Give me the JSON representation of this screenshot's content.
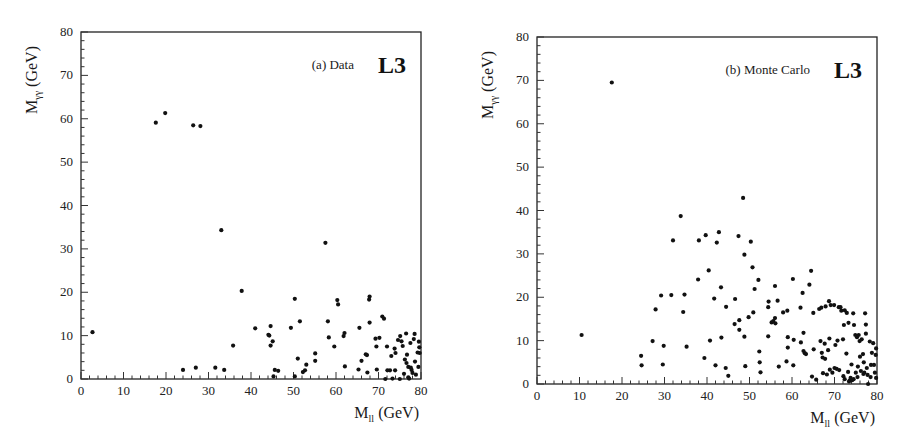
{
  "chart_data": [
    {
      "type": "scatter",
      "panel": "a",
      "label": "(a) Data",
      "logo": "L3",
      "xlabel": "M_ll (GeV)",
      "xlabel_main": "M",
      "xlabel_sub": "ll",
      "xlabel_unit": " (GeV)",
      "ylabel": "M_γγ (GeV)",
      "ylabel_main": "M",
      "ylabel_sub": "γγ",
      "ylabel_unit": " (GeV)",
      "xlim": [
        0,
        80
      ],
      "ylim": [
        0,
        80
      ],
      "xticks": [
        0,
        10,
        20,
        30,
        40,
        50,
        60,
        70,
        80
      ],
      "yticks": [
        0,
        10,
        20,
        30,
        40,
        50,
        60,
        70,
        80
      ],
      "grid": false,
      "marker": "filled-circle",
      "color": "#111111",
      "frame": {
        "x0": 81,
        "x1": 421,
        "y0": 379,
        "y1": 32
      },
      "points": [
        [
          2.7,
          10.8
        ],
        [
          17.6,
          59.1
        ],
        [
          19.8,
          61.3
        ],
        [
          26.4,
          58.5
        ],
        [
          28.1,
          58.3
        ],
        [
          33.0,
          34.3
        ],
        [
          37.8,
          20.3
        ],
        [
          24.0,
          2.1
        ],
        [
          27.0,
          2.6
        ],
        [
          31.6,
          2.6
        ],
        [
          33.7,
          2.1
        ],
        [
          35.8,
          7.7
        ],
        [
          41.0,
          11.7
        ],
        [
          44.1,
          10.2
        ],
        [
          44.3,
          10.0
        ],
        [
          44.6,
          12.2
        ],
        [
          44.6,
          7.7
        ],
        [
          45.1,
          8.7
        ],
        [
          45.3,
          0.6
        ],
        [
          45.6,
          2.1
        ],
        [
          46.4,
          1.9
        ],
        [
          49.4,
          11.8
        ],
        [
          50.3,
          18.5
        ],
        [
          50.3,
          0.6
        ],
        [
          51.0,
          4.7
        ],
        [
          51.5,
          13.3
        ],
        [
          52.2,
          1.6
        ],
        [
          52.7,
          2.0
        ],
        [
          53.0,
          3.3
        ],
        [
          55.1,
          5.9
        ],
        [
          55.1,
          4.2
        ],
        [
          57.5,
          31.4
        ],
        [
          58.1,
          13.3
        ],
        [
          58.3,
          9.6
        ],
        [
          59.6,
          7.5
        ],
        [
          60.3,
          18.2
        ],
        [
          60.5,
          17.2
        ],
        [
          61.8,
          9.9
        ],
        [
          62.0,
          10.6
        ],
        [
          62.1,
          2.9
        ],
        [
          65.3,
          2.2
        ],
        [
          65.5,
          11.8
        ],
        [
          66.0,
          4.2
        ],
        [
          67.0,
          5.7
        ],
        [
          67.3,
          5.5
        ],
        [
          67.4,
          1.5
        ],
        [
          67.8,
          18.3
        ],
        [
          67.9,
          19.0
        ],
        [
          67.9,
          13.0
        ],
        [
          69.3,
          9.3
        ],
        [
          69.5,
          7.5
        ],
        [
          69.6,
          2.2
        ],
        [
          70.2,
          9.5
        ],
        [
          70.9,
          14.4
        ],
        [
          71.3,
          13.9
        ],
        [
          72.0,
          7.5
        ],
        [
          71.6,
          0.0
        ],
        [
          72.1,
          2.0
        ],
        [
          72.7,
          2.0
        ],
        [
          73.0,
          5.3
        ],
        [
          73.3,
          0.1
        ],
        [
          73.8,
          7.0
        ],
        [
          73.9,
          2.0
        ],
        [
          74.0,
          6.0
        ],
        [
          74.6,
          9.0
        ],
        [
          75.0,
          0.0
        ],
        [
          75.1,
          9.9
        ],
        [
          75.4,
          8.7
        ],
        [
          75.7,
          7.6
        ],
        [
          76.0,
          1.2
        ],
        [
          76.2,
          4.5
        ],
        [
          76.5,
          10.5
        ],
        [
          76.6,
          3.7
        ],
        [
          76.7,
          5.6
        ],
        [
          77.0,
          2.8
        ],
        [
          77.0,
          0.4
        ],
        [
          77.2,
          0.1
        ],
        [
          77.5,
          8.3
        ],
        [
          77.6,
          2.6
        ],
        [
          77.8,
          2.1
        ],
        [
          78.0,
          1.4
        ],
        [
          78.3,
          9.2
        ],
        [
          78.5,
          10.4
        ],
        [
          78.6,
          4.0
        ],
        [
          78.8,
          1.0
        ],
        [
          79.2,
          6.1
        ],
        [
          79.5,
          8.6
        ],
        [
          79.6,
          7.3
        ],
        [
          79.7,
          6.0
        ],
        [
          79.4,
          2.8
        ]
      ]
    },
    {
      "type": "scatter",
      "panel": "b",
      "label": "(b) Monte Carlo",
      "logo": "L3",
      "xlabel": "M_ll (GeV)",
      "xlabel_main": "M",
      "xlabel_sub": "ll",
      "xlabel_unit": " (GeV)",
      "ylabel": "M_γγ (GeV)",
      "ylabel_main": "M",
      "ylabel_sub": "γγ",
      "ylabel_unit": " (GeV)",
      "xlim": [
        0,
        80
      ],
      "ylim": [
        0,
        80
      ],
      "xticks": [
        0,
        10,
        20,
        30,
        40,
        50,
        60,
        70,
        80
      ],
      "yticks": [
        0,
        10,
        20,
        30,
        40,
        50,
        60,
        70,
        80
      ],
      "grid": false,
      "marker": "filled-circle",
      "color": "#111111",
      "frame": {
        "x0": 84,
        "x1": 424,
        "y0": 384,
        "y1": 37
      },
      "points": [
        [
          10.5,
          11.3
        ],
        [
          17.6,
          69.5
        ],
        [
          24.5,
          6.5
        ],
        [
          24.6,
          4.3
        ],
        [
          27.2,
          9.9
        ],
        [
          27.9,
          17.2
        ],
        [
          29.2,
          20.4
        ],
        [
          29.6,
          4.5
        ],
        [
          29.8,
          8.8
        ],
        [
          31.6,
          20.5
        ],
        [
          32.0,
          33.1
        ],
        [
          33.8,
          38.7
        ],
        [
          34.4,
          16.6
        ],
        [
          34.7,
          20.6
        ],
        [
          35.2,
          8.6
        ],
        [
          37.9,
          24.1
        ],
        [
          38.1,
          33.1
        ],
        [
          39.4,
          6.0
        ],
        [
          39.7,
          34.3
        ],
        [
          40.4,
          26.2
        ],
        [
          40.7,
          10.0
        ],
        [
          41.7,
          19.7
        ],
        [
          42.0,
          4.3
        ],
        [
          42.3,
          32.6
        ],
        [
          42.8,
          35.0
        ],
        [
          43.3,
          22.3
        ],
        [
          43.4,
          10.7
        ],
        [
          44.4,
          3.7
        ],
        [
          44.5,
          17.8
        ],
        [
          45.0,
          1.9
        ],
        [
          46.5,
          13.8
        ],
        [
          46.6,
          19.6
        ],
        [
          47.4,
          34.1
        ],
        [
          47.6,
          14.7
        ],
        [
          47.6,
          12.5
        ],
        [
          48.5,
          42.9
        ],
        [
          48.8,
          29.8
        ],
        [
          48.8,
          10.9
        ],
        [
          49.0,
          4.1
        ],
        [
          49.8,
          15.4
        ],
        [
          50.3,
          32.8
        ],
        [
          50.7,
          26.9
        ],
        [
          50.9,
          16.5
        ],
        [
          51.2,
          21.9
        ],
        [
          52.1,
          24.0
        ],
        [
          52.3,
          7.5
        ],
        [
          52.4,
          5.0
        ],
        [
          52.6,
          2.7
        ],
        [
          54.4,
          17.7
        ],
        [
          54.5,
          19.0
        ],
        [
          54.4,
          11.0
        ],
        [
          55.2,
          14.2
        ],
        [
          55.6,
          14.5
        ],
        [
          56.0,
          15.2
        ],
        [
          56.1,
          14.0
        ],
        [
          56.0,
          22.6
        ],
        [
          56.6,
          19.2
        ],
        [
          56.9,
          4.0
        ],
        [
          57.9,
          16.5
        ],
        [
          58.7,
          5.2
        ],
        [
          58.9,
          16.9
        ],
        [
          59.0,
          10.8
        ],
        [
          59.0,
          8.4
        ],
        [
          60.2,
          24.2
        ],
        [
          60.3,
          4.3
        ],
        [
          60.4,
          10.2
        ],
        [
          62.0,
          17.6
        ],
        [
          62.1,
          9.6
        ],
        [
          62.5,
          21.0
        ],
        [
          62.7,
          11.8
        ],
        [
          62.7,
          7.6
        ],
        [
          63.0,
          7.1
        ],
        [
          63.3,
          6.9
        ],
        [
          64.1,
          22.9
        ],
        [
          64.5,
          26.1
        ],
        [
          64.7,
          1.7
        ],
        [
          65.0,
          16.4
        ],
        [
          65.1,
          8.0
        ],
        [
          65.7,
          1.0
        ],
        [
          66.4,
          17.3
        ],
        [
          66.7,
          9.9
        ],
        [
          66.9,
          17.6
        ],
        [
          67.0,
          7.2
        ],
        [
          67.2,
          6.1
        ],
        [
          67.3,
          2.5
        ],
        [
          67.7,
          9.3
        ],
        [
          67.8,
          5.8
        ],
        [
          67.9,
          17.9
        ],
        [
          68.2,
          2.2
        ],
        [
          68.5,
          7.8
        ],
        [
          68.8,
          10.5
        ],
        [
          68.7,
          19.1
        ],
        [
          68.9,
          3.3
        ],
        [
          69.1,
          18.2
        ],
        [
          69.5,
          2.6
        ],
        [
          69.9,
          18.2
        ],
        [
          70.0,
          3.7
        ],
        [
          70.2,
          9.0
        ],
        [
          70.5,
          3.5
        ],
        [
          70.7,
          10.0
        ],
        [
          71.0,
          17.7
        ],
        [
          71.1,
          3.2
        ],
        [
          71.4,
          17.7
        ],
        [
          71.6,
          16.9
        ],
        [
          72.0,
          10.3
        ],
        [
          72.2,
          13.6
        ],
        [
          72.1,
          1.8
        ],
        [
          72.4,
          17.0
        ],
        [
          72.4,
          1.1
        ],
        [
          72.8,
          7.0
        ],
        [
          72.9,
          16.4
        ],
        [
          73.2,
          2.8
        ],
        [
          73.3,
          14.1
        ],
        [
          73.4,
          0.6
        ],
        [
          73.6,
          0.8
        ],
        [
          73.8,
          1.4
        ],
        [
          74.0,
          4.5
        ],
        [
          74.2,
          0.9
        ],
        [
          74.4,
          16.3
        ],
        [
          74.6,
          13.6
        ],
        [
          74.5,
          1.1
        ],
        [
          74.9,
          11.3
        ],
        [
          75.0,
          2.6
        ],
        [
          75.3,
          10.8
        ],
        [
          75.4,
          1.6
        ],
        [
          75.5,
          4.0
        ],
        [
          75.7,
          11.3
        ],
        [
          75.9,
          9.9
        ],
        [
          76.0,
          6.3
        ],
        [
          76.2,
          3.0
        ],
        [
          76.4,
          10.3
        ],
        [
          76.7,
          6.9
        ],
        [
          76.8,
          2.3
        ],
        [
          76.9,
          5.0
        ],
        [
          77.0,
          2.6
        ],
        [
          77.2,
          16.3
        ],
        [
          77.4,
          11.6
        ],
        [
          77.4,
          13.7
        ],
        [
          77.6,
          3.7
        ],
        [
          77.8,
          2.1
        ],
        [
          77.9,
          0.0
        ],
        [
          78.3,
          9.8
        ],
        [
          78.5,
          1.6
        ],
        [
          78.6,
          4.4
        ],
        [
          78.8,
          7.2
        ],
        [
          79.1,
          9.4
        ],
        [
          79.3,
          4.4
        ],
        [
          79.5,
          2.6
        ],
        [
          79.7,
          6.7
        ],
        [
          79.8,
          8.2
        ],
        [
          79.8,
          1.4
        ]
      ]
    }
  ]
}
